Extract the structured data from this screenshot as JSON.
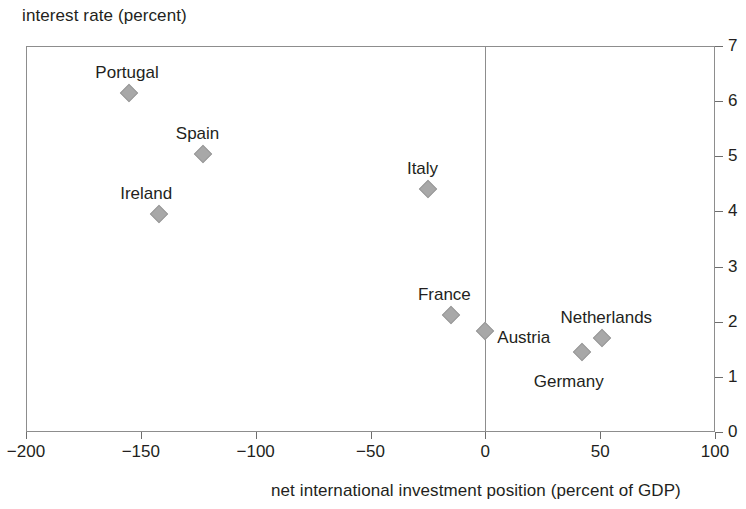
{
  "chart_data": {
    "type": "scatter",
    "title": "",
    "xlabel": "net international investment position (percent of GDP)",
    "ylabel": "interest rate (percent)",
    "xlim": [
      -200,
      100
    ],
    "ylim": [
      0,
      7
    ],
    "xticks": [
      -200,
      -150,
      -100,
      -50,
      0,
      50,
      100
    ],
    "xtick_labels": [
      "−200",
      "−150",
      "−100",
      "−50",
      "0",
      "50",
      "100"
    ],
    "yticks": [
      0,
      1,
      2,
      3,
      4,
      5,
      6,
      7
    ],
    "ytick_labels": [
      "0",
      "1",
      "2",
      "3",
      "4",
      "5",
      "6",
      "7"
    ],
    "grid": false,
    "legend": "none",
    "marker_shape": "diamond",
    "marker_color": "#a8a8a8",
    "axis_color": "#8d8d8d",
    "text_color": "#231f20",
    "zero_reference_line_x": 0,
    "points": [
      {
        "name": "Portugal",
        "x": -155,
        "y": 6.15,
        "label_dx": -34,
        "label_dy": -30
      },
      {
        "name": "Spain",
        "x": -123,
        "y": 5.05,
        "label_dx": -27,
        "label_dy": -30
      },
      {
        "name": "Ireland",
        "x": -142,
        "y": 3.96,
        "label_dx": -39,
        "label_dy": -30
      },
      {
        "name": "Italy",
        "x": -25,
        "y": 4.41,
        "label_dx": -21,
        "label_dy": -30
      },
      {
        "name": "France",
        "x": -15,
        "y": 2.12,
        "label_dx": -33,
        "label_dy": -30
      },
      {
        "name": "Austria",
        "x": 0,
        "y": 1.83,
        "label_dx": 12,
        "label_dy": -3
      },
      {
        "name": "Netherlands",
        "x": 51,
        "y": 1.71,
        "label_dx": -42,
        "label_dy": -30
      },
      {
        "name": "Germany",
        "x": 42,
        "y": 1.45,
        "label_dx": -48,
        "label_dy": 20
      }
    ]
  }
}
